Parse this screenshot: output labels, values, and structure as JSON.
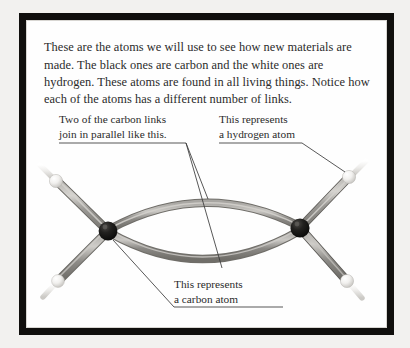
{
  "figure": {
    "intro_text": "These are the atoms we will use to see how new materials are made. The black ones are carbon and the white ones are hydrogen. These atoms are found in all living things. Notice how each of the atoms has a different number of links.",
    "frame_color": "#100f0d",
    "page_background": "#fefefe"
  },
  "annotations": {
    "carbon_links": {
      "line1": "Two of the carbon links",
      "line2": "join in parallel like this."
    },
    "hydrogen": {
      "line1": "This represents",
      "line2": "a hydrogen atom"
    },
    "carbon": {
      "line1": "This represents",
      "line2": "a carbon atom"
    }
  },
  "model": {
    "molecule": "ethylene",
    "carbon_atom_color": "#100f0d",
    "hydrogen_atom_color": "#f4f3f1",
    "bond_rod_color": "#8e8c88",
    "bond_highlight_color": "#c8c6c2",
    "leader_line_color": "#3a3a3a",
    "atoms": [
      {
        "element": "carbon",
        "label": "C",
        "x": 108,
        "y": 231,
        "links": 4
      },
      {
        "element": "carbon",
        "label": "C",
        "x": 300,
        "y": 228,
        "links": 4
      },
      {
        "element": "hydrogen",
        "label": "H",
        "x": 51,
        "y": 176,
        "links": 1
      },
      {
        "element": "hydrogen",
        "label": "H",
        "x": 355,
        "y": 170,
        "links": 1
      },
      {
        "element": "hydrogen",
        "label": "H",
        "x": 48,
        "y": 288,
        "links": 1
      },
      {
        "element": "hydrogen",
        "label": "H",
        "x": 352,
        "y": 287,
        "links": 1
      }
    ],
    "bonds": [
      {
        "type": "double",
        "from": "carbon",
        "to": "carbon",
        "description": "two curved parallel links"
      },
      {
        "type": "single",
        "from": "carbon",
        "to": "hydrogen",
        "count": 4
      }
    ]
  }
}
